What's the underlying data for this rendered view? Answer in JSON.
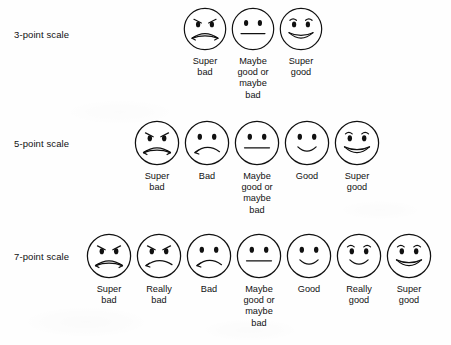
{
  "figure": {
    "type": "likert-smiley-scales",
    "background_color": "#fefefe",
    "ink_color": "#111111"
  },
  "rows": [
    {
      "label": "3-point scale",
      "label_top": 29,
      "row_top": 6,
      "strip_left": 181,
      "face_size": 46,
      "faces": [
        {
          "expression": "super-bad",
          "caption": "Super\nbad"
        },
        {
          "expression": "neutral",
          "caption": "Maybe\ngood or\nmaybe\nbad"
        },
        {
          "expression": "super-good",
          "caption": "Super\ngood"
        }
      ]
    },
    {
      "label": "5-point scale",
      "label_top": 138,
      "row_top": 119,
      "strip_left": 132,
      "face_size": 48,
      "faces": [
        {
          "expression": "super-bad",
          "caption": "Super\nbad"
        },
        {
          "expression": "bad",
          "caption": "Bad"
        },
        {
          "expression": "neutral",
          "caption": "Maybe\ngood or\nmaybe\nbad"
        },
        {
          "expression": "good",
          "caption": "Good"
        },
        {
          "expression": "super-good",
          "caption": "Super\ngood"
        }
      ]
    },
    {
      "label": "7-point scale",
      "label_top": 251,
      "row_top": 232,
      "strip_left": 84,
      "face_size": 48,
      "faces": [
        {
          "expression": "super-bad",
          "caption": "Super\nbad"
        },
        {
          "expression": "really-bad",
          "caption": "Really\nbad"
        },
        {
          "expression": "bad",
          "caption": "Bad"
        },
        {
          "expression": "neutral",
          "caption": "Maybe\ngood or\nmaybe\nbad"
        },
        {
          "expression": "good",
          "caption": "Good"
        },
        {
          "expression": "really-good",
          "caption": "Really\ngood"
        },
        {
          "expression": "super-good",
          "caption": "Super\ngood"
        }
      ]
    }
  ]
}
